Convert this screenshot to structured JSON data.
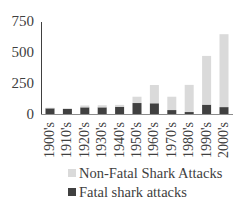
{
  "chart_data": {
    "type": "bar",
    "stacked": true,
    "title": "",
    "xlabel": "",
    "ylabel": "",
    "ylim": [
      0,
      750
    ],
    "yticks": [
      0,
      250,
      500,
      750
    ],
    "ytick_labels": [
      "0",
      "250",
      "500",
      "750"
    ],
    "grid": false,
    "legend_position": "bottom",
    "categories": [
      "1900's",
      "1910's",
      "1920's",
      "1930's",
      "1940's",
      "1950's",
      "1960's",
      "1970's",
      "1980's",
      "1990's",
      "2000's"
    ],
    "series": [
      {
        "name": "Fatal shark attacks",
        "color": "#404040",
        "values": [
          50,
          45,
          58,
          58,
          63,
          93,
          91,
          36,
          20,
          80,
          60
        ]
      },
      {
        "name": "Non-Fatal Shark Attacks",
        "color": "#dadada",
        "values": [
          5,
          5,
          15,
          17,
          15,
          51,
          148,
          108,
          220,
          395,
          591
        ]
      }
    ]
  },
  "legend": {
    "items": [
      {
        "label": "Non-Fatal Shark Attacks",
        "color": "#dadada"
      },
      {
        "label": "Fatal shark attacks",
        "color": "#404040"
      }
    ]
  },
  "colors": {
    "axis": "#404040",
    "text": "#404040"
  }
}
